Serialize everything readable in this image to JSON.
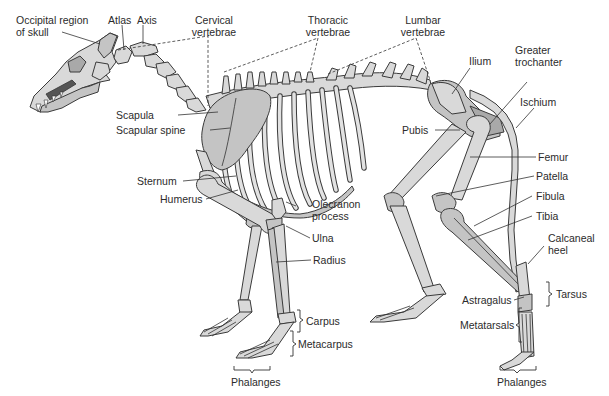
{
  "figure": {
    "labels": {
      "occipital": "Occipital region\nof skull",
      "occipital_line1": "Occipital region",
      "occipital_line2": "of skull",
      "atlas": "Atlas",
      "axis": "Axis",
      "cervical_line1": "Cervical",
      "cervical_line2": "vertebrae",
      "thoracic_line1": "Thoracic",
      "thoracic_line2": "vertebrae",
      "lumbar_line1": "Lumbar",
      "lumbar_line2": "vertebrae",
      "ilium": "Ilium",
      "greater_trochanter_line1": "Greater",
      "greater_trochanter_line2": "trochanter",
      "ischium": "Ischium",
      "scapula": "Scapula",
      "scapular_spine": "Scapular spine",
      "pubis": "Pubis",
      "femur": "Femur",
      "patella": "Patella",
      "sternum": "Sternum",
      "humerus": "Humerus",
      "fibula": "Fibula",
      "tibia": "Tibia",
      "olecranon_line1": "Olecranon",
      "olecranon_line2": "process",
      "ulna": "Ulna",
      "radius": "Radius",
      "calcaneal_line1": "Calcaneal",
      "calcaneal_line2": "heel",
      "tarsus": "Tarsus",
      "astragalus": "Astragalus",
      "metatarsals": "Metatarsals",
      "carpus": "Carpus",
      "metacarpus": "Metacarpus",
      "phalanges_fore": "Phalanges",
      "phalanges_hind": "Phalanges"
    },
    "colors": {
      "bone_light": "#d9d9d9",
      "bone_mid": "#c4c4c4",
      "bone_dark": "#a9a9a9",
      "outline": "#3a3a3a",
      "text": "#2b2b2b",
      "background": "#ffffff"
    }
  }
}
